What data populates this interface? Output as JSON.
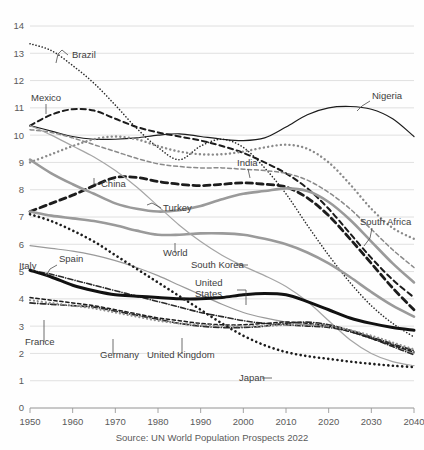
{
  "meta": {
    "source_note": "Source: UN World Population Prospects 2022",
    "title_cut_off": ""
  },
  "chart_data": {
    "type": "line",
    "title": "",
    "subtitle": "",
    "xlabel": "",
    "ylabel": "",
    "xlim": [
      1950,
      2040
    ],
    "ylim": [
      0,
      14
    ],
    "grid": true,
    "legend_position": "inline-labels",
    "xticks": [
      1950,
      1960,
      1970,
      1980,
      1990,
      2000,
      2010,
      2020,
      2030,
      2040
    ],
    "yticks": [
      0,
      1,
      2,
      3,
      4,
      5,
      6,
      7,
      8,
      9,
      10,
      11,
      12,
      13,
      14
    ],
    "x": [
      1950,
      1955,
      1960,
      1965,
      1970,
      1975,
      1980,
      1985,
      1990,
      1995,
      2000,
      2005,
      2010,
      2015,
      2020,
      2025,
      2030,
      2035,
      2040
    ],
    "annotation": "Source: UN World Population Prospects 2022",
    "series": [
      {
        "name": "Brazil",
        "label": "Brazil",
        "color": "#2b2b2b",
        "style": "dotted",
        "width": 1.6,
        "label_x": 72,
        "label_y": 58,
        "leader": "M68,55 L62,50 L58,54 L56,63",
        "values": [
          13.35,
          13.1,
          12.55,
          11.9,
          11.1,
          10.25,
          9.55,
          9.1,
          9.6,
          9.85,
          9.55,
          8.8,
          7.85,
          6.7,
          5.6,
          4.6,
          3.75,
          3.1,
          2.6
        ]
      },
      {
        "name": "Mexico",
        "label": "Mexico",
        "color": "#1c1c1c",
        "style": "dashed-med",
        "width": 2.0,
        "label_x": 31,
        "label_y": 101,
        "leader": "M46,104 L46,114",
        "values": [
          10.35,
          10.75,
          10.95,
          10.9,
          10.6,
          10.3,
          10.1,
          9.95,
          9.8,
          9.6,
          9.35,
          9.0,
          8.6,
          8.05,
          7.3,
          6.4,
          5.5,
          4.7,
          4.05
        ]
      },
      {
        "name": "Nigeria",
        "label": "Nigeria",
        "color": "#1c1c1c",
        "style": "solid",
        "width": 1.2,
        "label_x": 372,
        "label_y": 99,
        "leader": "M370,101 L362,106 L357,111",
        "values": [
          10.35,
          10.15,
          9.95,
          9.85,
          9.85,
          9.9,
          10.0,
          10.05,
          9.95,
          9.85,
          9.8,
          9.9,
          10.3,
          10.75,
          11.0,
          11.05,
          10.95,
          10.6,
          9.95
        ]
      },
      {
        "name": "India",
        "label": "India",
        "color": "#8a8a8a",
        "style": "dashed-med",
        "width": 1.5,
        "label_x": 237,
        "label_y": 166,
        "leader": "M248,169 L250,178",
        "values": [
          10.2,
          10.1,
          9.9,
          9.65,
          9.4,
          9.15,
          8.95,
          8.85,
          8.8,
          8.8,
          8.75,
          8.7,
          8.6,
          8.35,
          7.9,
          7.3,
          6.55,
          5.8,
          5.15
        ]
      },
      {
        "name": "South Africa",
        "label": "South Africa",
        "color": "#8a8a8a",
        "style": "dotted-thick",
        "width": 2.4,
        "label_x": 360,
        "label_y": 225,
        "leader": "M372,228 L370,238 L364,246",
        "values": [
          9.0,
          9.3,
          9.6,
          9.85,
          9.95,
          9.85,
          9.6,
          9.4,
          9.3,
          9.3,
          9.4,
          9.55,
          9.65,
          9.5,
          9.0,
          8.2,
          7.3,
          6.6,
          6.2
        ]
      },
      {
        "name": "China",
        "label": "China",
        "color": "#1c1c1c",
        "style": "dashed-thick",
        "width": 2.8,
        "label_x": 101,
        "label_y": 187,
        "leader": "M99,184 L94,184 L94,178",
        "values": [
          7.2,
          7.5,
          7.8,
          8.15,
          8.45,
          8.45,
          8.3,
          8.2,
          8.15,
          8.2,
          8.25,
          8.2,
          8.1,
          7.7,
          7.05,
          6.2,
          5.3,
          4.4,
          3.6
        ]
      },
      {
        "name": "Turkey",
        "label": "Turkey",
        "color": "#9a9a9a",
        "style": "solid",
        "width": 2.6,
        "label_x": 163,
        "label_y": 211,
        "leader": "M161,208 L152,203 L147,205",
        "values": [
          9.1,
          8.6,
          8.2,
          7.85,
          7.5,
          7.3,
          7.2,
          7.25,
          7.4,
          7.65,
          7.85,
          7.95,
          8.05,
          7.95,
          7.55,
          6.9,
          6.1,
          5.3,
          4.6
        ]
      },
      {
        "name": "World",
        "label": "World",
        "color": "#9a9a9a",
        "style": "solid",
        "width": 2.6,
        "label_x": 163,
        "label_y": 256,
        "leader": "M175,253 L175,243",
        "values": [
          7.2,
          7.05,
          6.95,
          6.85,
          6.7,
          6.5,
          6.35,
          6.35,
          6.4,
          6.4,
          6.35,
          6.2,
          6.0,
          5.7,
          5.3,
          4.8,
          4.25,
          3.75,
          3.35
        ]
      },
      {
        "name": "South Korea",
        "label": "South Korea",
        "color": "#a5a5a5",
        "style": "solid",
        "width": 1.2,
        "label_x": 191,
        "label_y": 268,
        "leader": "M236,265 L248,265",
        "values": [
          10.35,
          10.0,
          9.6,
          9.2,
          8.7,
          8.1,
          7.4,
          6.7,
          6.1,
          5.6,
          5.2,
          4.85,
          4.45,
          3.9,
          3.2,
          2.5,
          2.0,
          1.7,
          1.55
        ]
      },
      {
        "name": "Spain",
        "label": "Spain",
        "color": "#9a9a9a",
        "style": "solid",
        "width": 1.2,
        "label_x": 59,
        "label_y": 262,
        "leader": "M57,265 L50,269 L46,276",
        "values": [
          5.95,
          5.85,
          5.75,
          5.6,
          5.4,
          5.15,
          4.85,
          4.5,
          4.15,
          3.8,
          3.5,
          3.3,
          3.15,
          3.05,
          3.0,
          2.85,
          2.6,
          2.3,
          2.0
        ]
      },
      {
        "name": "Italy",
        "label": "Italy",
        "color": "#2b2b2b",
        "style": "dashdot",
        "width": 1.6,
        "label_x": 19,
        "label_y": 269,
        "leader": "",
        "values": [
          5.05,
          4.9,
          4.7,
          4.5,
          4.3,
          4.1,
          3.9,
          3.7,
          3.5,
          3.35,
          3.2,
          3.1,
          3.05,
          3.0,
          2.95,
          2.8,
          2.55,
          2.25,
          1.95
        ]
      },
      {
        "name": "United States",
        "label": "United States",
        "color": "#111111",
        "style": "solid",
        "width": 3.0,
        "label_x": 195,
        "label_y": 286,
        "leader": "M237,290 L246,290 L246,305",
        "values": [
          5.05,
          4.8,
          4.5,
          4.3,
          4.15,
          4.1,
          4.05,
          4.0,
          4.0,
          4.05,
          4.15,
          4.2,
          4.15,
          3.9,
          3.6,
          3.3,
          3.1,
          2.95,
          2.85
        ]
      },
      {
        "name": "France",
        "label": "France",
        "color": "#1c1c1c",
        "style": "dashed-fine",
        "width": 1.5,
        "label_x": 25,
        "label_y": 345,
        "leader": "M44,342 L44,320",
        "values": [
          4.05,
          3.95,
          3.85,
          3.75,
          3.6,
          3.45,
          3.3,
          3.2,
          3.1,
          3.05,
          3.05,
          3.1,
          3.15,
          3.1,
          3.0,
          2.8,
          2.55,
          2.3,
          2.05
        ]
      },
      {
        "name": "Germany",
        "label": "Germany",
        "color": "#2b2b2b",
        "style": "dashdot",
        "width": 1.7,
        "label_x": 100,
        "label_y": 358,
        "leader": "M113,354 L113,339",
        "values": [
          3.85,
          3.8,
          3.75,
          3.7,
          3.55,
          3.4,
          3.25,
          3.1,
          3.0,
          2.95,
          2.95,
          3.0,
          3.1,
          3.15,
          3.05,
          2.85,
          2.6,
          2.35,
          2.1
        ]
      },
      {
        "name": "United Kingdom",
        "label": "United Kingdom",
        "color": "#8f8f8f",
        "style": "dotted-thick",
        "width": 2.2,
        "label_x": 147,
        "label_y": 358,
        "leader": "M182,354 L182,338",
        "values": [
          3.95,
          3.85,
          3.75,
          3.65,
          3.5,
          3.35,
          3.2,
          3.1,
          3.05,
          3.0,
          3.0,
          3.0,
          3.05,
          3.05,
          3.0,
          2.85,
          2.65,
          2.4,
          2.15
        ]
      },
      {
        "name": "Japan",
        "label": "Japan",
        "color": "#1c1c1c",
        "style": "dotted-thick",
        "width": 2.6,
        "label_x": 239,
        "label_y": 381,
        "leader": "M262,378 L272,378",
        "values": [
          7.1,
          6.85,
          6.5,
          6.1,
          5.6,
          5.1,
          4.6,
          4.1,
          3.6,
          3.1,
          2.65,
          2.3,
          2.05,
          1.9,
          1.8,
          1.7,
          1.62,
          1.55,
          1.5
        ]
      }
    ]
  }
}
